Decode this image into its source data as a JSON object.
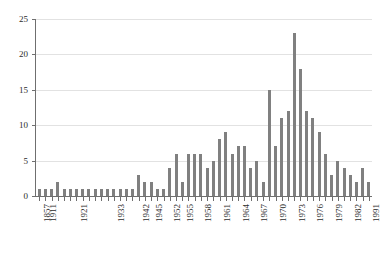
{
  "chart_data": {
    "type": "bar",
    "title": "",
    "subtitle": "",
    "xlabel": "",
    "ylabel": "",
    "ylim": [
      0,
      25
    ],
    "yticks": [
      0,
      5,
      10,
      15,
      20,
      25
    ],
    "grid": "horizontal",
    "legend": "none",
    "bar_color": "#808080",
    "gridline_color": "#e2e2e2",
    "axis_color": "#6f6f6f",
    "axis_type": "categorical-year",
    "xtick_labels": [
      "1857",
      "1911",
      "1921",
      "1933",
      "1942",
      "1945",
      "1952",
      "1955",
      "1958",
      "1961",
      "1964",
      "1967",
      "1970",
      "1973",
      "1976",
      "1979",
      "1982",
      "1991"
    ],
    "categories": [
      "1857",
      "1911",
      "1913",
      "1915",
      "1917",
      "1919",
      "1921",
      "1923",
      "1925",
      "1927",
      "1929",
      "1931",
      "1933",
      "1935",
      "1937",
      "1939",
      "1942",
      "1944",
      "1945",
      "1947",
      "1950",
      "1952",
      "1954",
      "1955",
      "1956",
      "1957",
      "1958",
      "1959",
      "1960",
      "1961",
      "1962",
      "1963",
      "1964",
      "1965",
      "1966",
      "1967",
      "1968",
      "1969",
      "1970",
      "1971",
      "1972",
      "1973",
      "1974",
      "1975",
      "1976",
      "1977",
      "1978",
      "1979",
      "1980",
      "1981",
      "1982",
      "1984",
      "1986",
      "1991"
    ],
    "values": [
      1,
      1,
      1,
      2,
      1,
      1,
      1,
      1,
      1,
      1,
      1,
      1,
      1,
      1,
      1,
      1,
      3,
      2,
      2,
      1,
      1,
      4,
      6,
      2,
      6,
      6,
      6,
      4,
      5,
      8,
      9,
      6,
      7,
      7,
      4,
      5,
      2,
      15,
      7,
      11,
      12,
      23,
      18,
      12,
      11,
      9,
      6,
      3,
      5,
      4,
      3,
      2,
      4,
      2
    ]
  }
}
